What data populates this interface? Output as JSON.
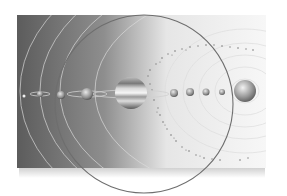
{
  "image": {
    "subject": "solar system illustration",
    "style": "grayscale",
    "colors": {
      "background": "#ffffff",
      "panel_dark": "#5a5a5a",
      "panel_light": "#f4f4f4",
      "orbit_line": "#dcdcdc",
      "overlay_circle": "#6e6e6e"
    }
  },
  "scene": {
    "frame": {
      "x": 17,
      "y": 15,
      "w": 249,
      "h": 153
    },
    "overlay_circle": {
      "cx": 144,
      "cy": 104,
      "r": 89
    },
    "sun": {
      "name": "sun",
      "cx": 245,
      "cy": 91,
      "r": 11
    },
    "planets": [
      {
        "name": "planet-1",
        "cx": 24,
        "cy": 96,
        "r": 1.5
      },
      {
        "name": "planet-2",
        "cx": 40,
        "cy": 94,
        "r": 3
      },
      {
        "name": "planet-3",
        "cx": 61,
        "cy": 95,
        "r": 4
      },
      {
        "name": "planet-4",
        "cx": 87,
        "cy": 94,
        "r": 6
      },
      {
        "name": "jupiter",
        "cx": 131,
        "cy": 93,
        "r": 16
      },
      {
        "name": "planet-6",
        "cx": 174,
        "cy": 93,
        "r": 4
      },
      {
        "name": "planet-7",
        "cx": 190,
        "cy": 92,
        "r": 4
      },
      {
        "name": "planet-8",
        "cx": 206,
        "cy": 92,
        "r": 3.5
      },
      {
        "name": "planet-9",
        "cx": 222,
        "cy": 92,
        "r": 3
      }
    ],
    "orbit_radii": [
      14,
      26,
      40,
      56,
      72,
      90,
      130,
      170,
      200,
      225
    ]
  }
}
